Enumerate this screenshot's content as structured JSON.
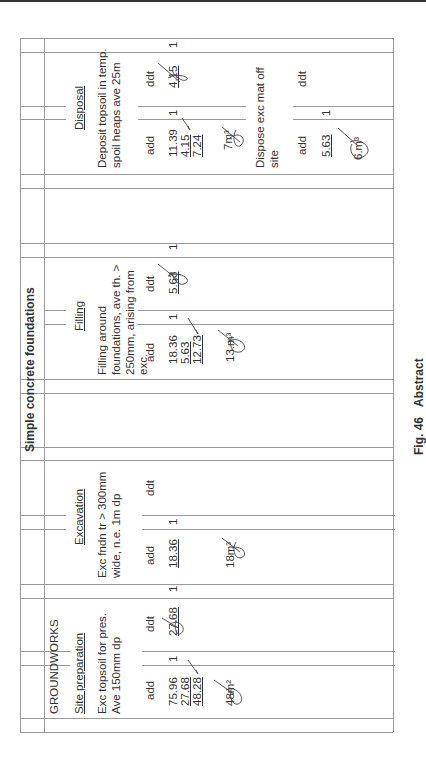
{
  "sheet": {
    "title": "Simple concrete foundations",
    "section": "GROUNDWORKS",
    "caption": {
      "fig": "Fig. 46",
      "label": "Abstract"
    }
  },
  "columns": {
    "site_preparation": {
      "heading": "Site preparation",
      "desc_line1": "Exc topsoil for pres.",
      "desc_line2": "Ave 150mm dp",
      "add_label": "add",
      "ddt_label": "ddt",
      "add_values": [
        "75.96",
        "27.68",
        "48.28"
      ],
      "ddt_values": [
        "27.68"
      ],
      "add_count": "1",
      "ddt_count": "1",
      "result": "48m²"
    },
    "excavation": {
      "heading": "Excavation",
      "desc_line1": "Exc fndn tr > 300mm",
      "desc_line2": "wide, n.e. 1m dp",
      "add_label": "add",
      "ddt_label": "ddt",
      "add_values": [
        "18.36"
      ],
      "add_count": "1",
      "result": "18m³"
    },
    "filling": {
      "heading": "Filling",
      "desc_line1": "Filling around",
      "desc_line2": "foundations, ave th. >",
      "desc_line3": "250mm, arising from",
      "desc_line4": "exc.",
      "add_label": "add",
      "ddt_label": "ddt",
      "add_values": [
        "18.36",
        "5.63",
        "12.73"
      ],
      "ddt_values": [
        "5.63"
      ],
      "add_count": "1",
      "ddt_count": "1",
      "result": "13.m³"
    },
    "disposal": {
      "heading": "Disposal",
      "item1": {
        "desc_line1": "Deposit topsoil in temp.",
        "desc_line2": "spoil heaps ave 25m",
        "add_label": "add",
        "ddt_label": "ddt",
        "add_values": [
          "11.39",
          "4.15",
          "7.24"
        ],
        "ddt_values": [
          "4.15"
        ],
        "add_count": "1",
        "ddt_count": "1",
        "result": "7m³"
      },
      "item2": {
        "desc_line1": "Dispose exc mat off",
        "desc_line2": "site",
        "add_label": "add",
        "ddt_label": "ddt",
        "add_values": [
          "5.63"
        ],
        "add_count": "1",
        "result": "6.m³"
      }
    }
  }
}
